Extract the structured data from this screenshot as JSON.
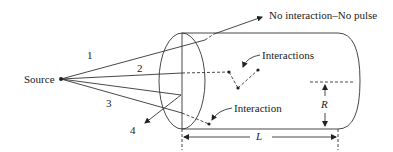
{
  "diagram": {
    "source_label": "Source",
    "ray_labels": [
      "1",
      "2",
      "3",
      "4"
    ],
    "no_interaction_label": "No interaction–No pulse",
    "interactions_label": "Interactions",
    "interaction_label": "Interaction",
    "radius_label": "R",
    "length_label": "L"
  },
  "colors": {
    "stroke": "#333333",
    "text": "#222222"
  }
}
